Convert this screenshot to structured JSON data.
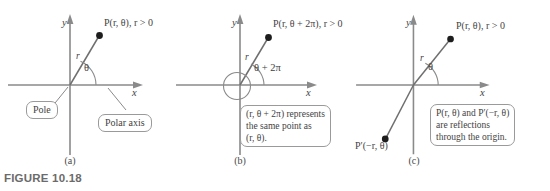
{
  "figure": {
    "caption": "FIGURE 10.18",
    "panels": [
      {
        "id": "a",
        "sublabel": "(a)",
        "x_axis_label": "x",
        "y_axis_label": "y",
        "radius_label": "r",
        "angle_label": "θ",
        "point_label": "P(r, θ), r > 0",
        "callouts": [
          {
            "name": "pole",
            "text": "Pole"
          },
          {
            "name": "polar-axis",
            "text": "Polar axis"
          }
        ]
      },
      {
        "id": "b",
        "sublabel": "(b)",
        "x_axis_label": "x",
        "y_axis_label": "y",
        "radius_label": "r",
        "angle_label": "θ + 2π",
        "point_label": "P(r, θ + 2π), r > 0",
        "callouts": [
          {
            "name": "same-point-note",
            "lines": [
              "(r, θ + 2π) represents",
              "the same point as",
              "(r, θ)."
            ]
          }
        ]
      },
      {
        "id": "c",
        "sublabel": "(c)",
        "x_axis_label": "x",
        "y_axis_label": "y",
        "radius_label": "r",
        "angle_label": "θ",
        "point_label": "P(r, θ), r > 0",
        "reflected_point_label": "P′(−r, θ)",
        "callouts": [
          {
            "name": "reflection-note",
            "lines": [
              "P(r, θ) and P′(−r, θ)",
              "are reflections",
              "through the origin."
            ]
          }
        ]
      }
    ]
  },
  "colors": {
    "axis": "#8a8a8a",
    "ray": "#6f6f6f",
    "point": "#1d1d1d",
    "text": "#3f3f3f",
    "caption": "#6b6b6b",
    "callout_border": "#9a9a9a",
    "background": "#ffffff"
  }
}
